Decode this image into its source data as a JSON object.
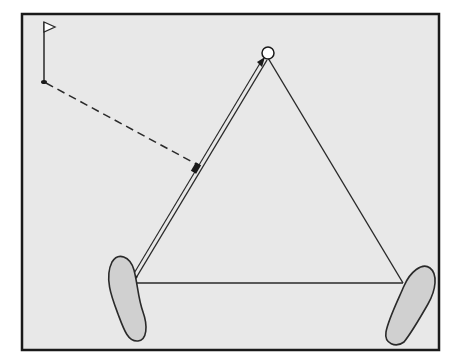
{
  "diagram": {
    "colors": {
      "background": "#e8e8e8",
      "frame": "#1a1a1a",
      "line": "#2a2a2a",
      "foot_fill": "#d0d0d0",
      "ball_fill": "#ffffff"
    },
    "elements": [
      "flag",
      "hole",
      "ball",
      "left-foot",
      "right-foot",
      "stance-line",
      "left-triangle-side",
      "right-triangle-side",
      "aim-arrow",
      "dashed-target-line"
    ]
  }
}
